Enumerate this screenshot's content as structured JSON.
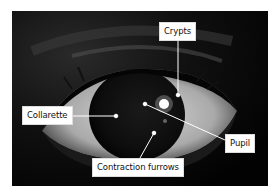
{
  "figure": {
    "labels": [
      {
        "id": "crypts",
        "text": "Crypts"
      },
      {
        "id": "collarette",
        "text": "Collarette"
      },
      {
        "id": "pupil",
        "text": "Pupil"
      },
      {
        "id": "contraction-furrows",
        "text": "Contraction furrows"
      }
    ]
  },
  "colors": {
    "background": "#ffffff",
    "photo_dark": "#050505",
    "sclera": "#bdbdbd",
    "leader_line": "#ffffff",
    "label_bg": "#ffffff",
    "label_text": "#111111"
  }
}
